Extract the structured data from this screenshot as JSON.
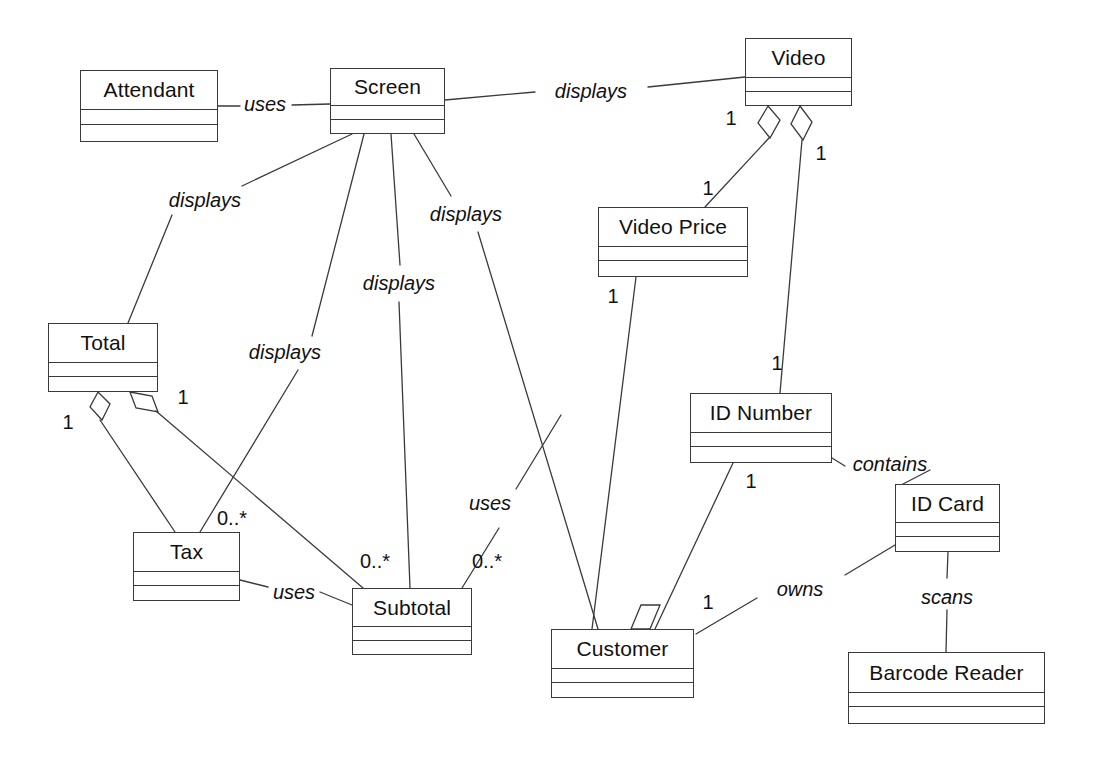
{
  "diagram": {
    "type": "uml-class-diagram",
    "canvas": {
      "width": 1095,
      "height": 769
    },
    "stroke_color": "#3a3a3a",
    "background_color": "#ffffff",
    "classes": [
      {
        "id": "attendant",
        "name": "Attendant",
        "x": 80,
        "y": 70,
        "w": 138,
        "h": 72,
        "name_h": 38
      },
      {
        "id": "screen",
        "name": "Screen",
        "x": 330,
        "y": 68,
        "w": 115,
        "h": 66,
        "name_h": 36
      },
      {
        "id": "video",
        "name": "Video",
        "x": 745,
        "y": 38,
        "w": 107,
        "h": 68,
        "name_h": 38
      },
      {
        "id": "video_price",
        "name": "Video Price",
        "x": 598,
        "y": 207,
        "w": 150,
        "h": 70,
        "name_h": 38
      },
      {
        "id": "total",
        "name": "Total",
        "x": 48,
        "y": 323,
        "w": 110,
        "h": 69,
        "name_h": 38
      },
      {
        "id": "id_number",
        "name": "ID Number",
        "x": 690,
        "y": 393,
        "w": 142,
        "h": 70,
        "name_h": 38
      },
      {
        "id": "id_card",
        "name": "ID Card",
        "x": 895,
        "y": 484,
        "w": 105,
        "h": 68,
        "name_h": 37
      },
      {
        "id": "tax",
        "name": "Tax",
        "x": 133,
        "y": 532,
        "w": 107,
        "h": 69,
        "name_h": 38
      },
      {
        "id": "subtotal",
        "name": "Subtotal",
        "x": 352,
        "y": 588,
        "w": 120,
        "h": 67,
        "name_h": 37
      },
      {
        "id": "customer",
        "name": "Customer",
        "x": 551,
        "y": 629,
        "w": 143,
        "h": 69,
        "name_h": 38
      },
      {
        "id": "barcode_reader",
        "name": "Barcode Reader",
        "x": 848,
        "y": 652,
        "w": 197,
        "h": 72,
        "name_h": 39
      }
    ],
    "associations": [
      {
        "id": "a1",
        "from": "attendant",
        "to": "screen",
        "label": "uses"
      },
      {
        "id": "a2",
        "from": "screen",
        "to": "video",
        "label": "displays"
      },
      {
        "id": "a3",
        "from": "screen",
        "to": "total",
        "label": "displays"
      },
      {
        "id": "a4",
        "from": "screen",
        "to": "tax",
        "label": "displays"
      },
      {
        "id": "a5",
        "from": "screen",
        "to": "subtotal",
        "label": "displays"
      },
      {
        "id": "a6",
        "from": "screen",
        "to": "customer",
        "label": "displays"
      },
      {
        "id": "a7",
        "from": "video",
        "to": "video_price",
        "label": "",
        "from_mult": "1",
        "to_mult": "1",
        "aggregation": "from"
      },
      {
        "id": "a8",
        "from": "video",
        "to": "id_number",
        "label": "",
        "from_mult": "1",
        "to_mult": "1",
        "aggregation": "from"
      },
      {
        "id": "a9",
        "from": "video_price",
        "to": "customer",
        "label": "",
        "from_mult": "1"
      },
      {
        "id": "a10",
        "from": "id_number",
        "to": "id_card",
        "label": "contains"
      },
      {
        "id": "a11",
        "from": "id_number",
        "to": "customer",
        "label": "",
        "from_mult": "1"
      },
      {
        "id": "a12",
        "from": "id_card",
        "to": "customer",
        "label": "owns",
        "to_mult": "1",
        "aggregation": "to"
      },
      {
        "id": "a13",
        "from": "id_card",
        "to": "barcode_reader",
        "label": "scans"
      },
      {
        "id": "a14",
        "from": "total",
        "to": "tax",
        "label": "",
        "from_mult": "1",
        "to_mult": "0..*",
        "aggregation": "from"
      },
      {
        "id": "a15",
        "from": "total",
        "to": "subtotal",
        "label": "",
        "from_mult": "1",
        "to_mult": "0..*",
        "aggregation": "from"
      },
      {
        "id": "a16",
        "from": "tax",
        "to": "subtotal",
        "label": "uses"
      }
    ],
    "edge_labels": [
      {
        "id": "l_uses_1",
        "text": "uses",
        "x": 265,
        "y": 104
      },
      {
        "id": "l_displays_1",
        "text": "displays",
        "x": 591,
        "y": 91
      },
      {
        "id": "l_displays_2",
        "text": "displays",
        "x": 205,
        "y": 200
      },
      {
        "id": "l_displays_3",
        "text": "displays",
        "x": 466,
        "y": 214
      },
      {
        "id": "l_displays_4",
        "text": "displays",
        "x": 399,
        "y": 283
      },
      {
        "id": "l_displays_5",
        "text": "displays",
        "x": 285,
        "y": 352
      },
      {
        "id": "l_contains",
        "text": "contains",
        "x": 890,
        "y": 464
      },
      {
        "id": "l_uses_2",
        "text": "uses",
        "x": 490,
        "y": 503
      },
      {
        "id": "l_uses_3",
        "text": "uses",
        "x": 294,
        "y": 592
      },
      {
        "id": "l_owns",
        "text": "owns",
        "x": 800,
        "y": 589
      },
      {
        "id": "l_scans",
        "text": "scans",
        "x": 947,
        "y": 597
      }
    ],
    "multiplicity_labels": [
      {
        "id": "m1",
        "text": "1",
        "x": 731,
        "y": 118
      },
      {
        "id": "m2",
        "text": "1",
        "x": 821,
        "y": 153
      },
      {
        "id": "m3",
        "text": "1",
        "x": 708,
        "y": 188
      },
      {
        "id": "m4",
        "text": "1",
        "x": 613,
        "y": 296
      },
      {
        "id": "m5",
        "text": "1",
        "x": 777,
        "y": 363
      },
      {
        "id": "m6",
        "text": "1",
        "x": 183,
        "y": 397
      },
      {
        "id": "m7",
        "text": "1",
        "x": 68,
        "y": 422
      },
      {
        "id": "m8",
        "text": "1",
        "x": 751,
        "y": 481
      },
      {
        "id": "m9",
        "text": "0..*",
        "x": 232,
        "y": 518
      },
      {
        "id": "m10",
        "text": "0..*",
        "x": 375,
        "y": 561
      },
      {
        "id": "m11",
        "text": "0..*",
        "x": 487,
        "y": 561
      },
      {
        "id": "m12",
        "text": "1",
        "x": 708,
        "y": 602
      }
    ]
  }
}
